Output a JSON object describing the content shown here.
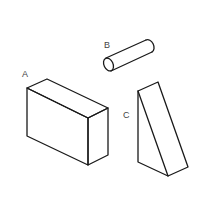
{
  "figure": {
    "labels": {
      "a": "A",
      "b": "B",
      "c": "C"
    },
    "shapes": [
      {
        "id": "A",
        "kind": "rectangular-block"
      },
      {
        "id": "B",
        "kind": "cylinder"
      },
      {
        "id": "C",
        "kind": "triangular-wedge"
      }
    ],
    "colors": {
      "stroke": "#1a1a1a",
      "label": "#444444",
      "background": "#ffffff"
    }
  }
}
